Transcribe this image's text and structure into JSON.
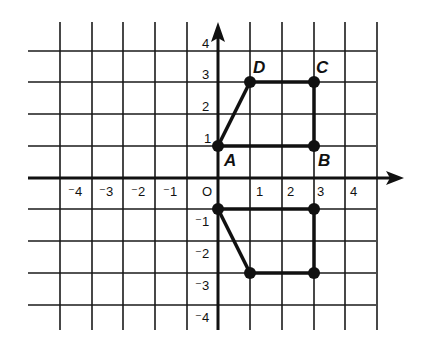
{
  "diagram": {
    "type": "coordinate-plane-reflection",
    "origin_label": "O",
    "x_ticks": [
      {
        "value": -4,
        "label": "⁻4"
      },
      {
        "value": -3,
        "label": "⁻3"
      },
      {
        "value": -2,
        "label": "⁻2"
      },
      {
        "value": -1,
        "label": "⁻1"
      },
      {
        "value": 1,
        "label": "1"
      },
      {
        "value": 2,
        "label": "2"
      },
      {
        "value": 3,
        "label": "3"
      },
      {
        "value": 4,
        "label": "4"
      }
    ],
    "y_ticks": [
      {
        "value": 4,
        "label": "4"
      },
      {
        "value": 3,
        "label": "3"
      },
      {
        "value": 2,
        "label": "2"
      },
      {
        "value": 1,
        "label": "1"
      },
      {
        "value": -1,
        "label": "⁻1"
      },
      {
        "value": -2,
        "label": "⁻2"
      },
      {
        "value": -3,
        "label": "⁻3"
      },
      {
        "value": -4,
        "label": "⁻4"
      }
    ],
    "original_figure": {
      "points": [
        {
          "name": "A",
          "x": 0,
          "y": 1
        },
        {
          "name": "B",
          "x": 3,
          "y": 1
        },
        {
          "name": "C",
          "x": 3,
          "y": 3
        },
        {
          "name": "D",
          "x": 1,
          "y": 3
        }
      ]
    },
    "image_figure": {
      "points": [
        {
          "x": 0,
          "y": -1
        },
        {
          "x": 3,
          "y": -1
        },
        {
          "x": 3,
          "y": -3
        },
        {
          "x": 1,
          "y": -3
        }
      ]
    },
    "labels": {
      "A": "A",
      "B": "B",
      "C": "C",
      "D": "D"
    }
  }
}
